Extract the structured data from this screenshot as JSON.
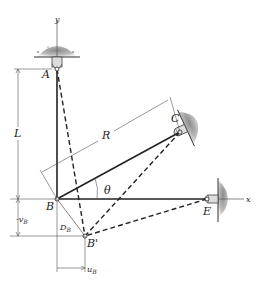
{
  "diagram": {
    "type": "structural truss displacement diagram",
    "points": {
      "A": {
        "label": "A",
        "x": 57,
        "y": 69
      },
      "B": {
        "label": "B",
        "x": 57,
        "y": 199
      },
      "B_prime": {
        "label": "B'",
        "x": 85,
        "y": 236
      },
      "C": {
        "label": "C",
        "x": 180,
        "y": 132
      },
      "E": {
        "label": "E",
        "x": 207,
        "y": 199
      }
    },
    "axes": {
      "x_label": "x",
      "y_label": "y"
    },
    "dimensions": {
      "L": "L",
      "R": "R",
      "theta": "θ",
      "v_B": {
        "main": "v",
        "sub": "B",
        "prefix": "-"
      },
      "u_B": {
        "main": "u",
        "sub": "B"
      },
      "D_B": {
        "main": "D",
        "sub": "B"
      }
    },
    "members": [
      {
        "name": "AB",
        "style": "solid"
      },
      {
        "name": "BC",
        "style": "solid"
      },
      {
        "name": "BE",
        "style": "solid"
      },
      {
        "name": "AB'",
        "style": "dashed"
      },
      {
        "name": "CB'",
        "style": "dashed"
      },
      {
        "name": "EB'",
        "style": "dashed"
      }
    ],
    "colors": {
      "line": "#222222",
      "support": "#9a9a9a",
      "dimension": "#555555"
    }
  }
}
